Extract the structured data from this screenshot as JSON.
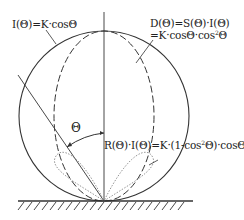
{
  "labels": {
    "lambert": "I(Θ)=K·cosΘ",
    "diffuse_line1": "D(Θ)=S(Θ)·I(Θ)",
    "diffuse_line2_a": "=K·cosΘ·cos",
    "diffuse_line2_sup": "2",
    "diffuse_line2_b": "Θ",
    "reflect_a": "R(Θ)·I(Θ)=K·(1-cos",
    "reflect_sup": "2",
    "reflect_b": "Θ)·cosΘ",
    "angle": "Θ"
  },
  "colors": {
    "stroke": "#333333",
    "dotted": "#888888"
  }
}
